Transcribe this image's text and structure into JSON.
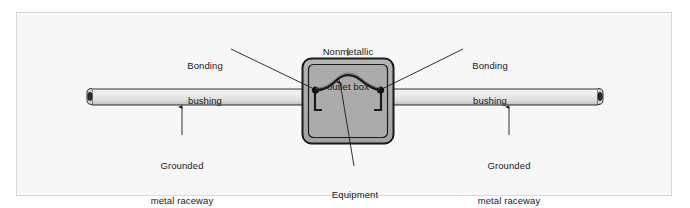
{
  "figure": {
    "background_color": "#f7f7f7",
    "frame_color": "#d8d8d8",
    "line_color": "#1a1a1a",
    "box_fill_color": "#a8a8a8",
    "box_inner_fill_color": "#b0b0b0",
    "raceway_fill_light": "#ededed",
    "raceway_fill_dark": "#b8b8b8"
  },
  "labels": {
    "outlet_box": {
      "line1": "Nonmetallic",
      "line2": "outlet box"
    },
    "bonding_bushing_left": {
      "line1": "Bonding",
      "line2": "bushing"
    },
    "bonding_bushing_right": {
      "line1": "Bonding",
      "line2": "bushing"
    },
    "raceway_left": {
      "line1": "Grounded",
      "line2": "metal raceway"
    },
    "raceway_right": {
      "line1": "Grounded",
      "line2": "metal raceway"
    },
    "bonding_jumper": {
      "line1": "Equipment",
      "line2": "bonding jumper"
    }
  },
  "parts": {
    "outlet_box": "nonmetallic-outlet-box",
    "left_raceway": "grounded-metal-raceway-left",
    "right_raceway": "grounded-metal-raceway-right",
    "left_bushing": "bonding-bushing-left",
    "right_bushing": "bonding-bushing-right",
    "jumper": "equipment-bonding-jumper"
  }
}
